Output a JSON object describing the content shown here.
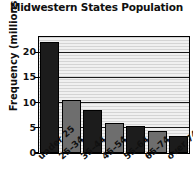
{
  "chart_data": {
    "type": "bar",
    "title": "Midwestern States Population",
    "xlabel": "",
    "ylabel": "Frequency (millions)",
    "categories": [
      "under 25",
      "25–34",
      "35–44",
      "45–54",
      "55–64",
      "65–74",
      "over 74"
    ],
    "values": [
      22,
      10.5,
      8.5,
      6,
      5.4,
      4.3,
      3.4
    ],
    "ylim": [
      0,
      23
    ],
    "yticks": [
      0,
      5,
      10,
      15,
      20
    ],
    "ytick_labels": [
      "0",
      "5",
      "10",
      "15",
      "20"
    ],
    "grid": true,
    "legend": null,
    "bar_colors": [
      "#1c1c1c",
      "#6e6e6e",
      "#1c1c1c",
      "#6e6e6e",
      "#1c1c1c",
      "#6e6e6e",
      "#1c1c1c"
    ],
    "plot_background": "#e2e2e2",
    "axis_color": "#000000"
  }
}
